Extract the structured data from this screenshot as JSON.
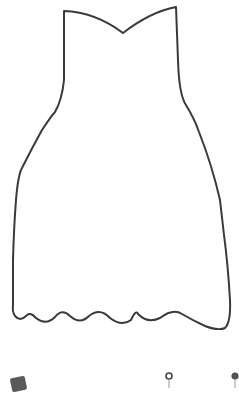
{
  "canvas": {
    "background": "#ffffff",
    "stroke_color": "#3a3a3a"
  },
  "drawing": {
    "subject": "dress-outline",
    "label": ""
  },
  "tools": [
    {
      "name": "color-swatch",
      "color": "#5a5a5a"
    },
    {
      "name": "pin-marker-1"
    },
    {
      "name": "pin-marker-2"
    }
  ]
}
